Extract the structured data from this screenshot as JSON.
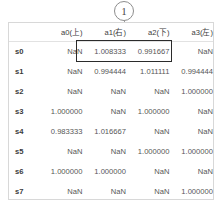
{
  "callout": {
    "marker_label": "1",
    "marker_icon": "circled-number-callout",
    "leader_line_icon": "leader-line"
  },
  "table": {
    "row_header_label": "",
    "columns": [
      "a0(上)",
      "a1(右)",
      "a2(下)",
      "a3(左)"
    ],
    "rows": [
      {
        "label": "s0",
        "values": [
          "NaN",
          "1.008333",
          "0.991667",
          "NaN"
        ]
      },
      {
        "label": "s1",
        "values": [
          "NaN",
          "0.994444",
          "1.011111",
          "0.994444"
        ]
      },
      {
        "label": "s2",
        "values": [
          "NaN",
          "NaN",
          "NaN",
          "1.000000"
        ]
      },
      {
        "label": "s3",
        "values": [
          "1.000000",
          "NaN",
          "1.000000",
          "NaN"
        ]
      },
      {
        "label": "s4",
        "values": [
          "0.983333",
          "1.016667",
          "NaN",
          "NaN"
        ]
      },
      {
        "label": "s5",
        "values": [
          "NaN",
          "NaN",
          "1.000000",
          "1.000000"
        ]
      },
      {
        "label": "s6",
        "values": [
          "1.000000",
          "1.000000",
          "NaN",
          "NaN"
        ]
      },
      {
        "label": "s7",
        "values": [
          "NaN",
          "NaN",
          "NaN",
          "1.000000"
        ]
      }
    ]
  },
  "highlight": {
    "name": "emphasis-box",
    "color": "#2b2b2b",
    "covers_row": "s0",
    "covers_columns": [
      "a1(右)",
      "a2(下)"
    ]
  },
  "colors": {
    "page_background": "#ffffff",
    "table_border": "#d8d8d8",
    "header_rule": "#e2e2e2",
    "text": "#4f4f4f",
    "header_text": "#3d3d3d",
    "callout_stroke": "#8d8d8d"
  }
}
